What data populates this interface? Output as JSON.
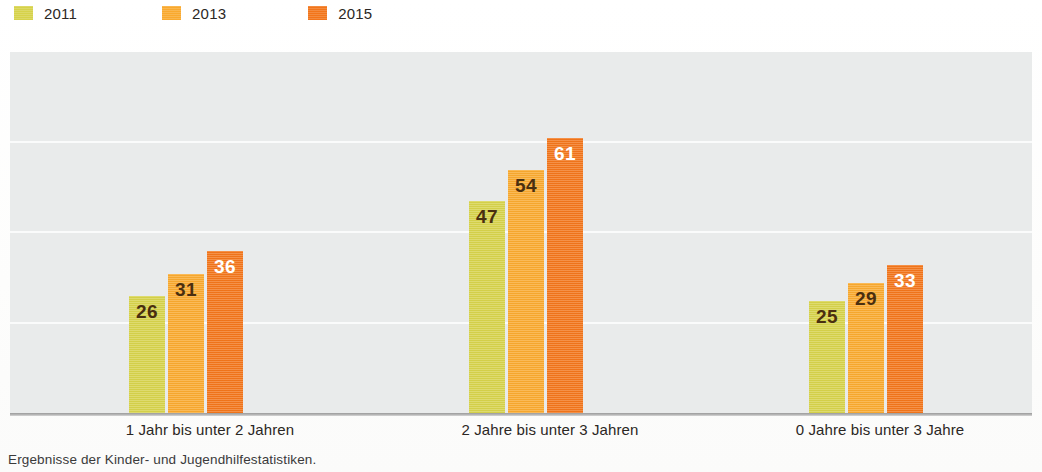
{
  "legend": {
    "items": [
      {
        "label": "2011",
        "color": "#d6d24a",
        "swatch_name": "legend-swatch-2011"
      },
      {
        "label": "2013",
        "color": "#f9a92e",
        "swatch_name": "legend-swatch-2013"
      },
      {
        "label": "2015",
        "color": "#f2751a",
        "swatch_name": "legend-swatch-2015"
      }
    ]
  },
  "footnote": {
    "text": "Ergebnisse der Kinder- und Jugendhilfestatistiken."
  },
  "colors": {
    "series_2011": "#d6d24a",
    "series_2013": "#f9a92e",
    "series_2015": "#f2751a",
    "plot_background": "#e9ebeb",
    "gridline": "#fafbfb",
    "axis": "#9b9b9b",
    "label_dark": "#4a2f10",
    "label_light": "#ffffff"
  },
  "chart_data": {
    "type": "bar",
    "title": "",
    "xlabel": "",
    "ylabel": "",
    "ylim": [
      0,
      80
    ],
    "grid": true,
    "legend_position": "top-left",
    "categories": [
      "1 Jahr bis unter 2 Jahren",
      "2 Jahre bis unter 3 Jahren",
      "0 Jahre bis unter 3 Jahre"
    ],
    "series": [
      {
        "name": "2011",
        "color": "#d6d24a",
        "values": [
          26,
          47,
          25
        ]
      },
      {
        "name": "2013",
        "color": "#f9a92e",
        "values": [
          31,
          54,
          29
        ]
      },
      {
        "name": "2015",
        "color": "#f2751a",
        "values": [
          36,
          61,
          33
        ]
      }
    ],
    "gridline_values": [
      20,
      40,
      60,
      80
    ],
    "value_labels": [
      [
        "26",
        "31",
        "36"
      ],
      [
        "47",
        "54",
        "61"
      ],
      [
        "25",
        "29",
        "33"
      ]
    ]
  }
}
